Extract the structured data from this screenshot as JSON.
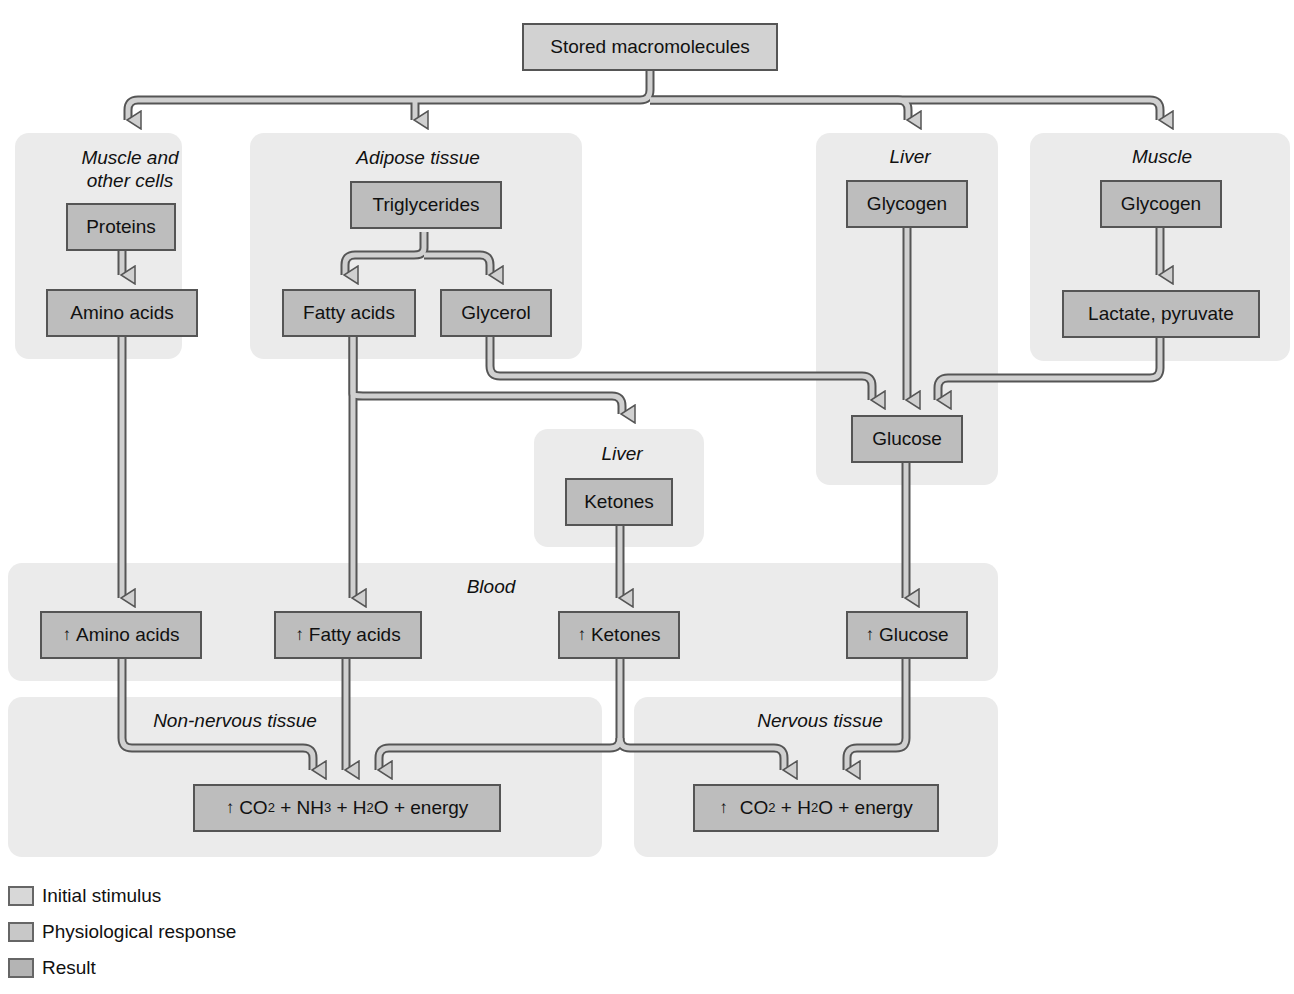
{
  "diagram": {
    "root": "Stored macromolecules",
    "regions": {
      "muscle_other": "Muscle and\nother cells",
      "muscle_other_line1": "Muscle and",
      "muscle_other_line2": "other cells",
      "adipose": "Adipose tissue",
      "liver_top": "Liver",
      "muscle": "Muscle",
      "liver_mid": "Liver",
      "blood": "Blood",
      "non_nervous": "Non-nervous tissue",
      "nervous": "Nervous tissue"
    },
    "nodes": {
      "proteins": "Proteins",
      "amino_acids": "Amino acids",
      "triglycerides": "Triglycerides",
      "fatty_acids": "Fatty acids",
      "glycerol": "Glycerol",
      "liver_glycogen": "Glycogen",
      "muscle_glycogen": "Glycogen",
      "lactate_pyruvate": "Lactate, pyruvate",
      "glucose": "Glucose",
      "ketones": "Ketones",
      "blood_amino_acids": "Amino acids",
      "blood_fatty_acids": "Fatty acids",
      "blood_ketones": "Ketones",
      "blood_glucose": "Glucose"
    },
    "increase_symbol": "↑",
    "results": {
      "non_nervous": {
        "co": "CO",
        "co_sub": "2",
        "nh": " + NH",
        "nh_sub": "3",
        "h": " + H",
        "h_sub": "2",
        "tail": "O + energy"
      },
      "nervous": {
        "co": "CO",
        "co_sub": "2",
        "h": " + H",
        "h_sub": "2",
        "tail": "O + energy"
      }
    }
  },
  "legend": [
    {
      "label": "Initial stimulus",
      "color": "#d8d8d8"
    },
    {
      "label": "Physiological response",
      "color": "#c8c8c8"
    },
    {
      "label": "Result",
      "color": "#b4b4b4"
    }
  ],
  "colors": {
    "region_bg": "#ebebeb",
    "box_fill": "#bdbdbd",
    "box_border": "#555555",
    "arrow_fill": "#d0d0d0",
    "arrow_stroke": "#555555"
  }
}
